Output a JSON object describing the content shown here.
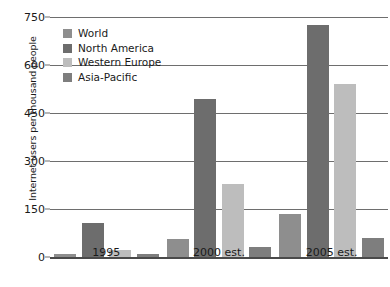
{
  "chart_data": {
    "type": "bar",
    "title": "",
    "xlabel": "",
    "ylabel": "Internet users per thousand people",
    "categories": [
      "1995",
      "2000 est.",
      "2005 est."
    ],
    "series": [
      {
        "name": "World",
        "color": "#8e8e8e",
        "values": [
          10,
          57,
          133
        ]
      },
      {
        "name": "North America",
        "color": "#6d6d6d",
        "values": [
          105,
          495,
          725
        ]
      },
      {
        "name": "Western Europe",
        "color": "#bdbdbd",
        "values": [
          22,
          228,
          540
        ]
      },
      {
        "name": "Asia-Pacific",
        "color": "#7e7e7e",
        "values": [
          10,
          30,
          58
        ]
      }
    ],
    "ylim": [
      0,
      750
    ],
    "yticks": [
      0,
      150,
      300,
      450,
      600,
      750
    ],
    "ytick_labels": [
      "0",
      "150",
      "300",
      "450",
      "600",
      "750"
    ],
    "grid": true,
    "legend_position": "top-left"
  }
}
